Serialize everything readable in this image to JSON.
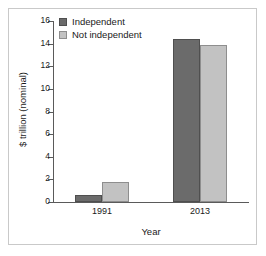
{
  "chart_data": {
    "type": "bar",
    "title": "",
    "xlabel": "Year",
    "ylabel": "$ trillion (nominal)",
    "categories": [
      "1991",
      "2013"
    ],
    "series": [
      {
        "name": "Independent",
        "values": [
          0.6,
          14.4
        ],
        "color": "#6b6b6b"
      },
      {
        "name": "Not independent",
        "values": [
          1.8,
          13.9
        ],
        "color": "#c2c2c2"
      }
    ],
    "ylim": [
      0,
      16
    ],
    "yticks": [
      0,
      2,
      4,
      6,
      8,
      10,
      12,
      14,
      16
    ],
    "ytick_labels": [
      "0",
      "2",
      "4",
      "6",
      "8",
      "10",
      "12",
      "14",
      "16"
    ],
    "grid": false,
    "legend_position": "top-left",
    "frame_color": "#c9c9c9",
    "axis_color": "#5a5a5a",
    "text_color": "#1a1a1a",
    "background": "#ffffff"
  }
}
